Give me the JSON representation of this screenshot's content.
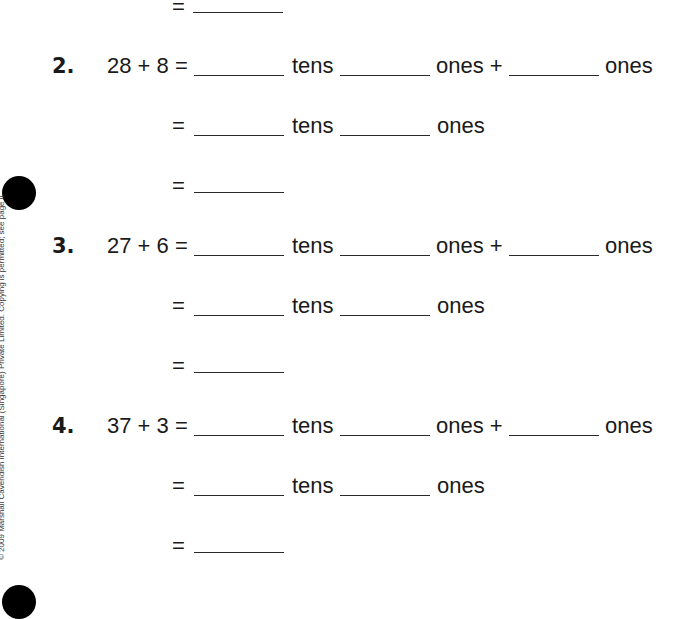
{
  "page": {
    "copyright": "© 2009 Marshall Cavendish International (Singapore) Private Limited. Copying is permitted; see page ii."
  },
  "top_fragment": {
    "equals": "="
  },
  "problems": [
    {
      "number": "2.",
      "expression": "28 + 8 =",
      "tens_label": "tens",
      "ones_label": "ones +",
      "ones_label2": "ones",
      "equals": "=",
      "equals_final": "="
    },
    {
      "number": "3.",
      "expression": "27 + 6 =",
      "tens_label": "tens",
      "ones_label": "ones +",
      "ones_label2": "ones",
      "equals": "=",
      "equals_final": "="
    },
    {
      "number": "4.",
      "expression": "37 + 3 =",
      "tens_label": "tens",
      "ones_label": "ones +",
      "ones_label2": "ones",
      "equals": "=",
      "equals_final": "="
    }
  ]
}
